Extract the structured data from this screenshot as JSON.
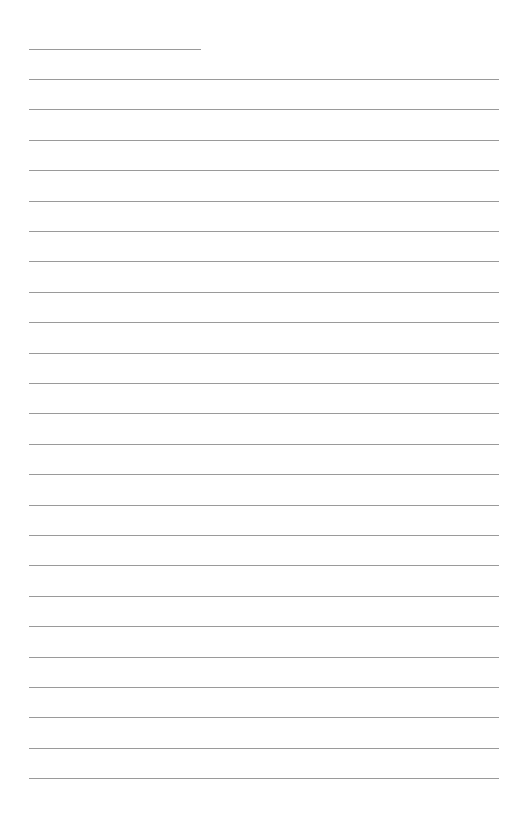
{
  "document": {
    "type": "blank lined sheet",
    "header_line": {
      "label": "",
      "value": ""
    },
    "writing_lines": [
      {
        "text": ""
      },
      {
        "text": ""
      },
      {
        "text": ""
      },
      {
        "text": ""
      },
      {
        "text": ""
      },
      {
        "text": ""
      },
      {
        "text": ""
      },
      {
        "text": ""
      },
      {
        "text": ""
      },
      {
        "text": ""
      },
      {
        "text": ""
      },
      {
        "text": ""
      },
      {
        "text": ""
      },
      {
        "text": ""
      },
      {
        "text": ""
      },
      {
        "text": ""
      },
      {
        "text": ""
      },
      {
        "text": ""
      },
      {
        "text": ""
      },
      {
        "text": ""
      },
      {
        "text": ""
      },
      {
        "text": ""
      },
      {
        "text": ""
      },
      {
        "text": ""
      }
    ],
    "line_color": "#9a9a9a"
  }
}
